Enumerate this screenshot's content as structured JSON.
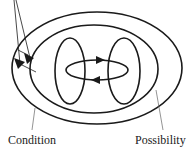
{
  "diagram": {
    "type": "nested-ellipses",
    "labels": {
      "condition": "Condition",
      "possibility": "Possibility"
    },
    "elements": {
      "outer_ellipse": {
        "cx": 97,
        "cy": 68,
        "rx": 85,
        "ry": 56
      },
      "middle_ellipse": {
        "cx": 94,
        "cy": 69,
        "rx": 64,
        "ry": 44
      },
      "left_inner_ellipse": {
        "cx": 70,
        "cy": 71,
        "rx": 15,
        "ry": 33
      },
      "right_inner_ellipse": {
        "cx": 124,
        "cy": 71,
        "rx": 16,
        "ry": 33
      },
      "horizontal_loop_ellipse": {
        "cx": 97,
        "cy": 70,
        "rx": 31,
        "ry": 10
      }
    },
    "arrows": [
      {
        "name": "loop-top-arrow",
        "direction": "right"
      },
      {
        "name": "loop-bottom-arrow",
        "direction": "left"
      },
      {
        "name": "pointer-arrow-outer",
        "direction": "down-right"
      },
      {
        "name": "pointer-arrow-inner",
        "direction": "down-right"
      }
    ],
    "colors": {
      "stroke": "#1a1a1a",
      "pointer_line": "#555555",
      "background": "#ffffff"
    }
  }
}
